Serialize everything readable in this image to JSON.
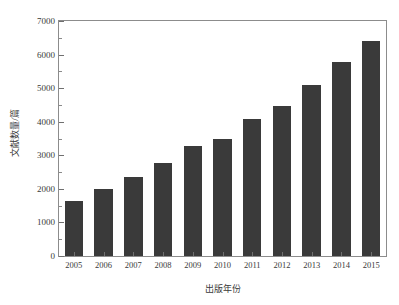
{
  "chart_data": {
    "type": "bar",
    "title": "",
    "subtitle": "",
    "xlabel": "出版年份",
    "ylabel": "文献数量/篇",
    "categories": [
      "2005",
      "2006",
      "2007",
      "2008",
      "2009",
      "2010",
      "2011",
      "2012",
      "2013",
      "2014",
      "2015"
    ],
    "values": [
      1650,
      2000,
      2350,
      2780,
      3270,
      3500,
      4080,
      4480,
      5080,
      5780,
      6400
    ],
    "series": [
      {
        "name": "文献数量",
        "values": [
          1650,
          2000,
          2350,
          2780,
          3270,
          3500,
          4080,
          4480,
          5080,
          5780,
          6400
        ]
      }
    ],
    "ylim": [
      0,
      7000
    ],
    "y_ticks": [
      0,
      1000,
      2000,
      3000,
      4000,
      5000,
      6000,
      7000
    ],
    "y_tick_labels": [
      "0",
      "1000",
      "2000",
      "3000",
      "4000",
      "5000",
      "6000",
      "7000"
    ],
    "y_minor_ticks": [
      500,
      1500,
      2500,
      3500,
      4500,
      5500,
      6500
    ],
    "x_tick_labels": [
      "2005",
      "2006",
      "2007",
      "2008",
      "2009",
      "2010",
      "2011",
      "2012",
      "2013",
      "2014",
      "2015"
    ],
    "grid": false,
    "legend": false,
    "legend_position": "none",
    "bar_color": "#3a3a3a",
    "axis_color": "#8c8c8c",
    "background_color": "#ffffff",
    "bar_width_ratio": 0.62
  }
}
